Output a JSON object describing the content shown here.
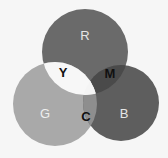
{
  "diagram": {
    "type": "venn",
    "background": "#f6f6f6",
    "circles": [
      {
        "id": "red",
        "label": "R",
        "cx": 85,
        "cy": 52,
        "r": 43,
        "fill": "#6a6a6a",
        "label_color": "#e6e6e6"
      },
      {
        "id": "green",
        "label": "G",
        "cx": 55,
        "cy": 104,
        "r": 42,
        "fill": "#a9a9a9",
        "label_color": "#eeeeee"
      },
      {
        "id": "blue",
        "label": "B",
        "cx": 121,
        "cy": 103,
        "r": 38,
        "fill": "#5e5e5e",
        "label_color": "#e6e6e6"
      }
    ],
    "overlaps": [
      {
        "id": "yellow",
        "label": "Y",
        "sets": [
          "red",
          "green"
        ],
        "fill": "#f7f7f7",
        "label_color": "#111111"
      },
      {
        "id": "magenta",
        "label": "M",
        "sets": [
          "red",
          "blue"
        ],
        "fill": "#4a4a4a",
        "label_color": "#111111"
      },
      {
        "id": "cyan",
        "label": "C",
        "sets": [
          "green",
          "blue"
        ],
        "fill": "#8e8e8e",
        "label_color": "#111111"
      }
    ],
    "labels": {
      "R": "R",
      "G": "G",
      "B": "B",
      "Y": "Y",
      "M": "M",
      "C": "C"
    }
  }
}
